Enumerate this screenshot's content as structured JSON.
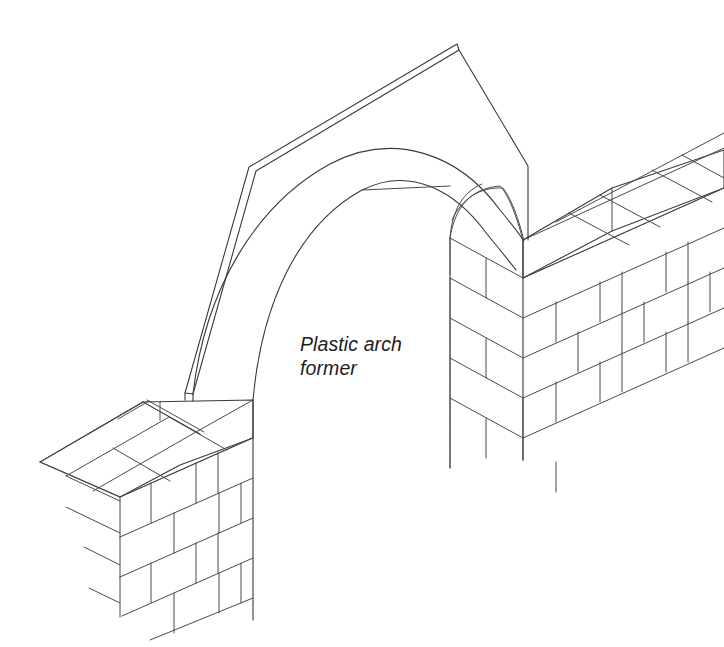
{
  "figure": {
    "kind": "isometric-line-drawing",
    "background_color": "#ffffff",
    "line_color": "#3a3a3a"
  },
  "labels": {
    "arch_former": {
      "line1": "Plastic arch",
      "line2": "former",
      "x": 300,
      "y": 332,
      "style": "italic"
    }
  },
  "components": {
    "left_pier": {
      "name": "left brick pier",
      "bond": "stretcher bond",
      "visible_courses": 6
    },
    "right_pier": {
      "name": "right brick pier",
      "bond": "stretcher bond",
      "visible_courses": 5
    },
    "arch_former": {
      "name": "plastic arch former",
      "material": "plastic",
      "apex_peak": true
    }
  }
}
